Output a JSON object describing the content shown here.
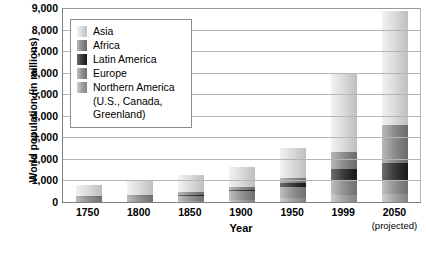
{
  "chart_data": {
    "type": "bar",
    "subtype": "stacked-bar",
    "title": "",
    "xlabel": "Year",
    "ylabel": "World population (in millions)",
    "ylim": [
      0,
      9000
    ],
    "ytick_labels": [
      "9,000",
      "8,000",
      "7,000",
      "6,000",
      "5,000",
      "4,000",
      "3,000",
      "2,000",
      "1,000",
      "0"
    ],
    "ytick_values": [
      9000,
      8000,
      7000,
      6000,
      5000,
      4000,
      3000,
      2000,
      1000,
      0
    ],
    "grid": true,
    "legend_position": "upper-left-inside",
    "categories": [
      "1750",
      "1800",
      "1850",
      "1900",
      "1950",
      "1999",
      "2050"
    ],
    "category_sublabels": [
      "",
      "",
      "",
      "",
      "",
      "",
      "(projected)"
    ],
    "series": [
      {
        "name": "Northern America (U.S., Canada, Greenland)",
        "short_name": "Northern America",
        "color": "#8e8e8e",
        "values": [
          2,
          7,
          26,
          82,
          172,
          307,
          392
        ]
      },
      {
        "name": "Europe",
        "short_name": "Europe",
        "color": "#949494",
        "values": [
          163,
          203,
          276,
          408,
          547,
          729,
          628
        ]
      },
      {
        "name": "Latin America",
        "short_name": "Latin America",
        "color": "#3d3d3d",
        "values": [
          16,
          24,
          38,
          74,
          167,
          511,
          809
        ]
      },
      {
        "name": "Africa",
        "short_name": "Africa",
        "color": "#8e8e8e",
        "values": [
          106,
          107,
          111,
          133,
          221,
          767,
          1766
        ]
      },
      {
        "name": "Asia",
        "short_name": "Asia",
        "color": "#dcdcdc",
        "values": [
          502,
          635,
          809,
          947,
          1402,
          3634,
          5268
        ]
      }
    ],
    "totals": [
      789,
      976,
      1260,
      1644,
      2509,
      5948,
      8863
    ],
    "stack_order_bottom_to_top": [
      "Northern America",
      "Europe",
      "Latin America",
      "Africa",
      "Asia"
    ]
  },
  "legend": {
    "items": [
      {
        "label": "Asia",
        "swatch": "swatch-asia"
      },
      {
        "label": "Africa",
        "swatch": "swatch-africa"
      },
      {
        "label": "Latin America",
        "swatch": "swatch-latin"
      },
      {
        "label": "Europe",
        "swatch": "swatch-europe"
      },
      {
        "label": "Northern America",
        "swatch": "swatch-north"
      }
    ],
    "continuation_line_1": "(U.S., Canada,",
    "continuation_line_2": "Greenland)"
  }
}
